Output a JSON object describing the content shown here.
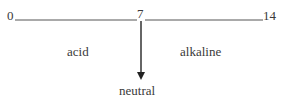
{
  "diagram": {
    "scale": {
      "min_label": "0",
      "mid_label": "7",
      "max_label": "14"
    },
    "regions": {
      "left_label": "acid",
      "right_label": "alkaline"
    },
    "pointer": {
      "label": "neutral"
    },
    "colors": {
      "line": "#3a3a3a",
      "text": "#3a3a3a"
    }
  }
}
